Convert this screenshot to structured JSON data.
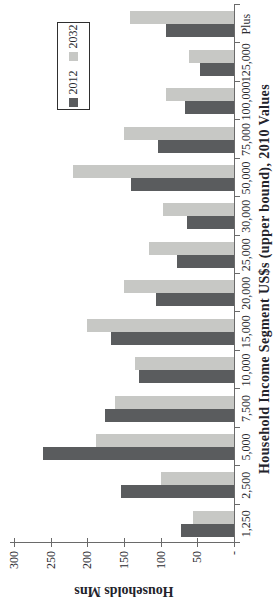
{
  "chart_data": {
    "type": "bar",
    "title": "",
    "xlabel": "Household Income Segment US$s (upper bound), 2010 Values",
    "ylabel": "Households Mns",
    "categories": [
      "1,250",
      "2,500",
      "5,000",
      "7,500",
      "10,000",
      "15,000",
      "20,000",
      "25,000",
      "30,000",
      "50,000",
      "75,000",
      "100,000",
      "125,000",
      "Plus"
    ],
    "series": [
      {
        "name": "2012",
        "color": "#5a5c5e",
        "values": [
          72,
          154,
          260,
          176,
          130,
          168,
          107,
          78,
          64,
          141,
          104,
          67,
          46,
          93
        ]
      },
      {
        "name": "2032",
        "color": "#c7c8c5",
        "values": [
          56,
          99,
          188,
          162,
          135,
          200,
          150,
          116,
          97,
          219,
          150,
          93,
          62,
          142
        ]
      }
    ],
    "ylim": [
      0,
      300
    ],
    "y_tick_interval": 50,
    "y_tick_labels": [
      "300",
      "250",
      "200",
      "150",
      "100",
      "50",
      "-"
    ],
    "grid": false,
    "legend_position": "top-right",
    "orientation": "rendered landscape, image rotated 90 degrees counter-clockwise"
  },
  "colors": {
    "background": "#ffffff",
    "axis_line": "#6a6a6a",
    "tick_text": "#2b2b30",
    "title_text": "#23232b",
    "legend_border": "#2f2f2f"
  }
}
